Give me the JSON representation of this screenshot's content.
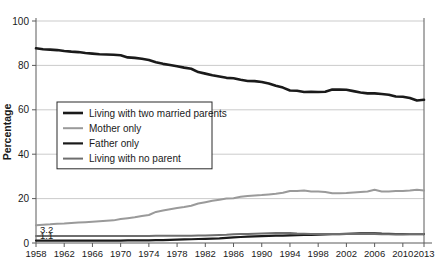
{
  "chart_data": {
    "type": "line",
    "title": "",
    "xlabel": "",
    "ylabel": "Percentage",
    "xlim": [
      1958,
      2013
    ],
    "ylim": [
      0,
      100
    ],
    "grid": true,
    "legend_position": "center-left",
    "x_ticks": [
      1958,
      1962,
      1966,
      1970,
      1974,
      1978,
      1982,
      1986,
      1990,
      1994,
      1998,
      2002,
      2006,
      2010,
      2013
    ],
    "y_ticks": [
      0,
      20,
      40,
      60,
      80,
      100
    ],
    "x": [
      1958,
      1959,
      1960,
      1961,
      1962,
      1963,
      1964,
      1965,
      1966,
      1967,
      1968,
      1969,
      1970,
      1971,
      1972,
      1973,
      1974,
      1975,
      1976,
      1977,
      1978,
      1979,
      1980,
      1981,
      1982,
      1983,
      1984,
      1985,
      1986,
      1987,
      1988,
      1989,
      1990,
      1991,
      1992,
      1993,
      1994,
      1995,
      1996,
      1997,
      1998,
      1999,
      2000,
      2001,
      2002,
      2003,
      2004,
      2005,
      2006,
      2007,
      2008,
      2009,
      2010,
      2011,
      2012,
      2013
    ],
    "series": [
      {
        "name": "Living with two married parents",
        "color": "#1a1a1a",
        "width": 2.6,
        "values": [
          87.7,
          87.3,
          87.1,
          86.9,
          86.5,
          86.2,
          86.0,
          85.6,
          85.3,
          85.0,
          84.9,
          84.8,
          84.6,
          83.6,
          83.4,
          83.0,
          82.4,
          81.4,
          80.7,
          80.2,
          79.6,
          79.0,
          78.5,
          77.0,
          76.3,
          75.6,
          75.0,
          74.4,
          74.2,
          73.5,
          73.0,
          72.9,
          72.5,
          71.8,
          70.8,
          70.0,
          68.7,
          68.6,
          68.0,
          68.1,
          68.0,
          68.1,
          69.1,
          69.1,
          69.0,
          68.4,
          67.8,
          67.4,
          67.4,
          67.1,
          66.8,
          66.0,
          65.9,
          65.3,
          64.2,
          64.5
        ]
      },
      {
        "name": "Mother only",
        "color": "#9a9a9a",
        "width": 2.0,
        "values": [
          8.0,
          8.2,
          8.4,
          8.7,
          8.8,
          9.0,
          9.2,
          9.4,
          9.6,
          9.8,
          10.0,
          10.2,
          10.8,
          11.2,
          11.6,
          12.2,
          12.6,
          14.0,
          14.6,
          15.2,
          15.8,
          16.2,
          16.8,
          17.8,
          18.4,
          19.0,
          19.5,
          20.0,
          20.2,
          20.8,
          21.2,
          21.4,
          21.6,
          21.9,
          22.2,
          22.6,
          23.4,
          23.4,
          23.6,
          23.2,
          23.2,
          23.0,
          22.4,
          22.4,
          22.5,
          22.8,
          23.0,
          23.2,
          24.0,
          23.2,
          23.2,
          23.4,
          23.4,
          23.6,
          24.0,
          23.7
        ]
      },
      {
        "name": "Father only",
        "color": "#1a1a1a",
        "width": 2.2,
        "values": [
          1.1,
          1.1,
          1.1,
          1.1,
          1.1,
          1.1,
          1.1,
          1.1,
          1.1,
          1.1,
          1.1,
          1.1,
          1.1,
          1.2,
          1.2,
          1.2,
          1.2,
          1.3,
          1.3,
          1.4,
          1.5,
          1.6,
          1.7,
          1.8,
          1.9,
          2.0,
          2.1,
          2.3,
          2.5,
          2.7,
          2.9,
          3.0,
          3.1,
          3.2,
          3.3,
          3.3,
          3.4,
          3.5,
          3.6,
          3.7,
          3.8,
          3.9,
          4.0,
          4.0,
          4.1,
          4.2,
          4.3,
          4.3,
          4.4,
          4.2,
          4.1,
          4.0,
          4.0,
          4.0,
          4.0,
          4.0
        ]
      },
      {
        "name": "Living with no parent",
        "color": "#6e6e6e",
        "width": 2.0,
        "values": [
          3.2,
          3.2,
          3.2,
          3.2,
          3.2,
          3.2,
          3.2,
          3.2,
          3.2,
          3.2,
          3.2,
          3.2,
          3.2,
          3.2,
          3.2,
          3.2,
          3.2,
          3.3,
          3.3,
          3.3,
          3.3,
          3.3,
          3.3,
          3.4,
          3.4,
          3.5,
          3.6,
          3.7,
          3.9,
          4.0,
          4.1,
          4.2,
          4.3,
          4.4,
          4.5,
          4.5,
          4.5,
          4.3,
          4.2,
          4.1,
          4.1,
          4.0,
          4.0,
          4.0,
          4.0,
          4.0,
          4.0,
          4.0,
          4.0,
          3.9,
          3.9,
          3.9,
          3.9,
          4.0,
          4.0,
          4.0
        ]
      }
    ],
    "annotations": [
      {
        "text": "3.2",
        "x": 1958,
        "y": 3.2,
        "dx": 4,
        "dy": -3
      },
      {
        "text": "1.1",
        "x": 1958,
        "y": 1.1,
        "dx": 4,
        "dy": -2
      }
    ]
  },
  "legend": {
    "items": [
      {
        "label": "Living with two married parents"
      },
      {
        "label": "Mother only"
      },
      {
        "label": "Father only"
      },
      {
        "label": "Living with no parent"
      }
    ]
  },
  "axes": {
    "y_title": "Percentage"
  }
}
